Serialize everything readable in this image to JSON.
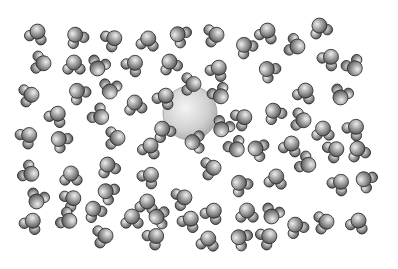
{
  "scene": {
    "description": "Space-filling illustration of water molecules surrounding a central ion (hydration shell)",
    "background": "#ffffff",
    "atom_colors": {
      "light": "#e6e6e6",
      "mid": "#9a9a9a",
      "dark": "#3c3c3c"
    },
    "ion": {
      "x": 190,
      "y": 113,
      "r": 27
    },
    "shell": [
      {
        "x": 192,
        "y": 84,
        "a": 90
      },
      {
        "x": 220,
        "y": 95,
        "a": 150
      },
      {
        "x": 222,
        "y": 128,
        "a": 210
      },
      {
        "x": 194,
        "y": 142,
        "a": 270
      },
      {
        "x": 163,
        "y": 130,
        "a": 330
      },
      {
        "x": 165,
        "y": 97,
        "a": 30
      }
    ],
    "molecules": [
      {
        "x": 37,
        "y": 33,
        "a": 20
      },
      {
        "x": 76,
        "y": 36,
        "a": -30
      },
      {
        "x": 113,
        "y": 39,
        "a": 60
      },
      {
        "x": 148,
        "y": 40,
        "a": 10
      },
      {
        "x": 179,
        "y": 35,
        "a": -60
      },
      {
        "x": 42,
        "y": 63,
        "a": 100
      },
      {
        "x": 74,
        "y": 64,
        "a": 0
      },
      {
        "x": 98,
        "y": 67,
        "a": 200
      },
      {
        "x": 134,
        "y": 64,
        "a": 40
      },
      {
        "x": 170,
        "y": 63,
        "a": -20
      },
      {
        "x": 30,
        "y": 95,
        "a": 80
      },
      {
        "x": 78,
        "y": 92,
        "a": -40
      },
      {
        "x": 110,
        "y": 90,
        "a": 190
      },
      {
        "x": 135,
        "y": 104,
        "a": -10
      },
      {
        "x": 57,
        "y": 115,
        "a": 30
      },
      {
        "x": 100,
        "y": 116,
        "a": 130
      },
      {
        "x": 28,
        "y": 136,
        "a": 50
      },
      {
        "x": 60,
        "y": 140,
        "a": -50
      },
      {
        "x": 116,
        "y": 138,
        "a": 90
      },
      {
        "x": 150,
        "y": 147,
        "a": 20
      },
      {
        "x": 30,
        "y": 173,
        "a": 120
      },
      {
        "x": 71,
        "y": 175,
        "a": 0
      },
      {
        "x": 108,
        "y": 166,
        "a": -20
      },
      {
        "x": 150,
        "y": 176,
        "a": 40
      },
      {
        "x": 37,
        "y": 200,
        "a": 200
      },
      {
        "x": 72,
        "y": 199,
        "a": 60
      },
      {
        "x": 107,
        "y": 192,
        "a": -60
      },
      {
        "x": 147,
        "y": 203,
        "a": 10
      },
      {
        "x": 183,
        "y": 198,
        "a": 70
      },
      {
        "x": 32,
        "y": 222,
        "a": 30
      },
      {
        "x": 68,
        "y": 220,
        "a": 120
      },
      {
        "x": 94,
        "y": 210,
        "a": -30
      },
      {
        "x": 104,
        "y": 236,
        "a": 80
      },
      {
        "x": 132,
        "y": 218,
        "a": 0
      },
      {
        "x": 155,
        "y": 237,
        "a": 50
      },
      {
        "x": 158,
        "y": 217,
        "a": -80
      },
      {
        "x": 190,
        "y": 220,
        "a": 30
      },
      {
        "x": 215,
        "y": 35,
        "a": 80
      },
      {
        "x": 245,
        "y": 46,
        "a": -40
      },
      {
        "x": 267,
        "y": 32,
        "a": 20
      },
      {
        "x": 296,
        "y": 46,
        "a": 110
      },
      {
        "x": 320,
        "y": 27,
        "a": -20
      },
      {
        "x": 330,
        "y": 58,
        "a": 40
      },
      {
        "x": 354,
        "y": 67,
        "a": 150
      },
      {
        "x": 218,
        "y": 69,
        "a": 30
      },
      {
        "x": 268,
        "y": 70,
        "a": -50
      },
      {
        "x": 305,
        "y": 92,
        "a": 20
      },
      {
        "x": 341,
        "y": 96,
        "a": 200
      },
      {
        "x": 243,
        "y": 118,
        "a": 60
      },
      {
        "x": 274,
        "y": 112,
        "a": -30
      },
      {
        "x": 302,
        "y": 120,
        "a": 100
      },
      {
        "x": 323,
        "y": 130,
        "a": 0
      },
      {
        "x": 355,
        "y": 128,
        "a": 40
      },
      {
        "x": 236,
        "y": 148,
        "a": 150
      },
      {
        "x": 257,
        "y": 149,
        "a": -70
      },
      {
        "x": 291,
        "y": 145,
        "a": 20
      },
      {
        "x": 335,
        "y": 150,
        "a": 60
      },
      {
        "x": 358,
        "y": 150,
        "a": -20
      },
      {
        "x": 212,
        "y": 168,
        "a": 80
      },
      {
        "x": 240,
        "y": 184,
        "a": -40
      },
      {
        "x": 276,
        "y": 178,
        "a": 10
      },
      {
        "x": 307,
        "y": 164,
        "a": 120
      },
      {
        "x": 340,
        "y": 183,
        "a": 40
      },
      {
        "x": 365,
        "y": 180,
        "a": -60
      },
      {
        "x": 213,
        "y": 212,
        "a": 30
      },
      {
        "x": 247,
        "y": 212,
        "a": 0
      },
      {
        "x": 272,
        "y": 215,
        "a": 200
      },
      {
        "x": 296,
        "y": 226,
        "a": -30
      },
      {
        "x": 325,
        "y": 222,
        "a": 80
      },
      {
        "x": 358,
        "y": 222,
        "a": 20
      },
      {
        "x": 240,
        "y": 238,
        "a": -60
      },
      {
        "x": 268,
        "y": 237,
        "a": 60
      },
      {
        "x": 208,
        "y": 240,
        "a": 10
      }
    ]
  }
}
